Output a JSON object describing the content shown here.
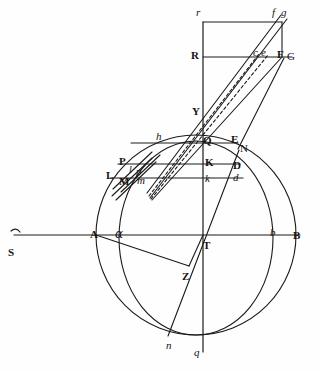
{
  "figure": {
    "stroke_color": "#1a1a1a",
    "background_color": "#ffffff"
  },
  "labels": [
    {
      "id": "r",
      "text": "r",
      "style": "italic",
      "x": 196,
      "y": 7,
      "name": "point-label-r"
    },
    {
      "id": "f",
      "text": "f",
      "style": "italic",
      "x": 272,
      "y": 7,
      "name": "point-label-f"
    },
    {
      "id": "g",
      "text": "g",
      "style": "italic",
      "x": 281,
      "y": 7,
      "name": "point-label-g"
    },
    {
      "id": "R",
      "text": "R",
      "style": "roman",
      "x": 191,
      "y": 50,
      "name": "point-label-R"
    },
    {
      "id": "c",
      "text": "c",
      "style": "italic",
      "x": 253,
      "y": 47,
      "name": "point-label-c"
    },
    {
      "id": "e",
      "text": "e",
      "style": "italic",
      "x": 261,
      "y": 47,
      "name": "point-label-e"
    },
    {
      "id": "F",
      "text": "F",
      "style": "roman",
      "x": 277,
      "y": 49,
      "name": "point-label-F"
    },
    {
      "id": "G",
      "text": "G",
      "style": "roman-lt",
      "x": 287,
      "y": 51,
      "name": "point-label-G"
    },
    {
      "id": "Y",
      "text": "Y",
      "style": "roman",
      "x": 192,
      "y": 106,
      "name": "point-label-Y"
    },
    {
      "id": "h",
      "text": "h",
      "style": "italic",
      "x": 156,
      "y": 131,
      "name": "point-label-h"
    },
    {
      "id": "Q",
      "text": "Q",
      "style": "roman",
      "x": 203,
      "y": 135,
      "name": "point-label-Q"
    },
    {
      "id": "E",
      "text": "E",
      "style": "roman",
      "x": 231,
      "y": 134,
      "name": "point-label-E"
    },
    {
      "id": "N",
      "text": "N",
      "style": "roman-lt",
      "x": 240,
      "y": 143,
      "name": "point-label-N"
    },
    {
      "id": "P",
      "text": "P",
      "style": "roman",
      "x": 119,
      "y": 156,
      "name": "point-label-P"
    },
    {
      "id": "K",
      "text": "K",
      "style": "roman",
      "x": 205,
      "y": 157,
      "name": "point-label-K"
    },
    {
      "id": "D",
      "text": "D",
      "style": "roman",
      "x": 233,
      "y": 160,
      "name": "point-label-D"
    },
    {
      "id": "L",
      "text": "L",
      "style": "roman",
      "x": 106,
      "y": 170,
      "name": "point-label-L"
    },
    {
      "id": "l",
      "text": "l",
      "style": "italic-sm",
      "x": 129,
      "y": 165,
      "name": "point-label-l"
    },
    {
      "id": "p",
      "text": "p",
      "style": "italic",
      "x": 136,
      "y": 166,
      "name": "point-label-p"
    },
    {
      "id": "M",
      "text": "M",
      "style": "roman",
      "x": 119,
      "y": 176,
      "name": "point-label-M"
    },
    {
      "id": "m",
      "text": "m",
      "style": "italic",
      "x": 137,
      "y": 175,
      "name": "point-label-m"
    },
    {
      "id": "k",
      "text": "k",
      "style": "italic",
      "x": 205,
      "y": 173,
      "name": "point-label-k"
    },
    {
      "id": "d",
      "text": "d",
      "style": "italic",
      "x": 233,
      "y": 172,
      "name": "point-label-d"
    },
    {
      "id": "A",
      "text": "A",
      "style": "roman",
      "x": 90,
      "y": 229,
      "name": "point-label-A"
    },
    {
      "id": "alpha",
      "text": "α",
      "style": "greek",
      "x": 115,
      "y": 228,
      "name": "point-label-alpha"
    },
    {
      "id": "T",
      "text": "T",
      "style": "roman",
      "x": 203,
      "y": 240,
      "name": "point-label-T"
    },
    {
      "id": "b",
      "text": "b",
      "style": "italic",
      "x": 270,
      "y": 227,
      "name": "point-label-b"
    },
    {
      "id": "B",
      "text": "B",
      "style": "roman",
      "x": 293,
      "y": 230,
      "name": "point-label-B"
    },
    {
      "id": "S",
      "text": "S",
      "style": "roman",
      "x": 8,
      "y": 247,
      "name": "point-label-S"
    },
    {
      "id": "Z",
      "text": "Z",
      "style": "roman",
      "x": 182,
      "y": 271,
      "name": "point-label-Z"
    },
    {
      "id": "n",
      "text": "n",
      "style": "italic",
      "x": 166,
      "y": 340,
      "name": "point-label-n"
    },
    {
      "id": "q",
      "text": "q",
      "style": "italic",
      "x": 194,
      "y": 347,
      "name": "point-label-q"
    }
  ],
  "geometry": {
    "center_T": {
      "x": 203,
      "y": 235
    },
    "vertical_axis": {
      "x": 203,
      "top": 22,
      "bottom": 352
    },
    "horizontal_axis": {
      "y": 235,
      "left": 14,
      "right": 300
    },
    "outer_circle": {
      "cx": 196,
      "cy": 235,
      "r": 100,
      "name": "outer-circle"
    },
    "inner_ellipse": {
      "cx": 196,
      "cy": 238,
      "rx": 77,
      "ry": 97,
      "name": "inner-ellipse"
    },
    "rectangle_top": {
      "x1": 203,
      "y1": 22,
      "x2": 282,
      "y2": 57
    },
    "horizontal_chords": [
      {
        "y": 57,
        "x1": 203,
        "x2": 292,
        "name": "chord-R-G"
      },
      {
        "y": 143,
        "x1": 124,
        "x2": 238,
        "name": "chord-Q-E"
      },
      {
        "y": 164,
        "x1": 118,
        "x2": 240,
        "name": "chord-P-D"
      },
      {
        "y": 178,
        "x1": 111,
        "x2": 243,
        "name": "chord-L-M-d"
      }
    ],
    "rays_from_Y": [
      {
        "to_x": 280,
        "to_y": 16,
        "dashed": false,
        "name": "ray-Y-f"
      },
      {
        "to_x": 286,
        "to_y": 18,
        "dashed": false,
        "name": "ray-Y-g"
      },
      {
        "to_x": 258,
        "to_y": 55,
        "dashed": true,
        "name": "ray-Y-c"
      },
      {
        "to_x": 266,
        "to_y": 55,
        "dashed": true,
        "name": "ray-Y-e"
      },
      {
        "to_x": 281,
        "to_y": 57,
        "dashed": false,
        "name": "ray-Y-F"
      }
    ],
    "oblique_lines": [
      {
        "x1": 96,
        "y1": 235,
        "x2": 189,
        "y2": 268,
        "name": "line-A-Z"
      },
      {
        "x1": 203,
        "y1": 235,
        "x2": 189,
        "y2": 268,
        "name": "line-T-Z"
      },
      {
        "x1": 238,
        "y1": 148,
        "x2": 284,
        "y2": 58,
        "name": "line-N-G"
      },
      {
        "x1": 113,
        "y1": 190,
        "x2": 285,
        "y2": 17,
        "name": "line-L-g-long"
      },
      {
        "x1": 169,
        "y1": 335,
        "x2": 240,
        "y2": 150,
        "name": "line-n-N"
      }
    ],
    "sun_marker": {
      "x": 14,
      "y": 234,
      "name": "sun-arc-marker"
    }
  }
}
